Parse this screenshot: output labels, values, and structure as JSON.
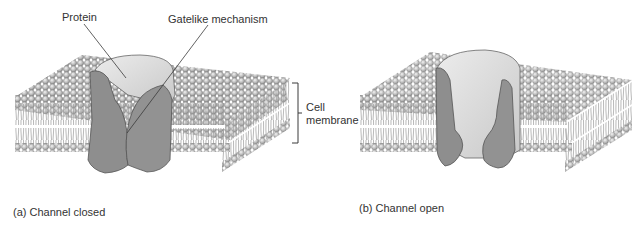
{
  "figure": {
    "labels": {
      "protein": "Protein",
      "gate": "Gatelike mechanism",
      "cell_membrane_line1": "Cell",
      "cell_membrane_line2": "membrane"
    },
    "panels": [
      {
        "caption": "(a) Channel closed",
        "state": "closed"
      },
      {
        "caption": "(b) Channel open",
        "state": "open"
      }
    ],
    "colors": {
      "protein_dark": "#8e8e8e",
      "protein_light": "#dcdcdc",
      "lipid_head": "#bdbdbd",
      "lipid_tail": "#9a9a9a",
      "leader_line": "#3a3a3a"
    }
  }
}
